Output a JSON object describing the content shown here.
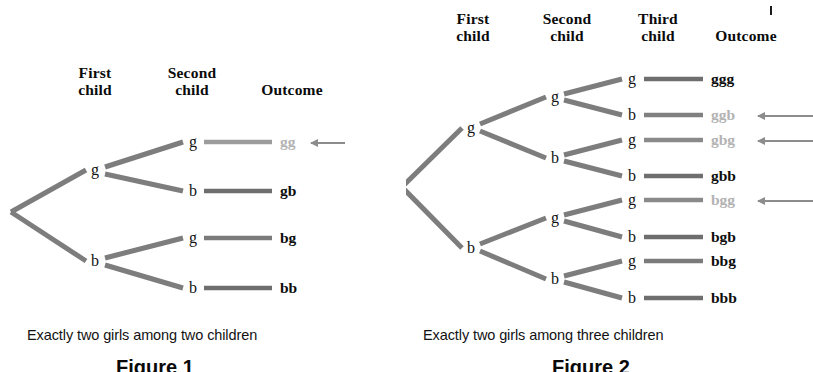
{
  "figure": {
    "background_color": "#ffffff",
    "branch_color": "#7d7d7d",
    "leaf_line_color": "#6e6e6e",
    "dim_text_color": "#b3b3b3",
    "text_color": "#0d0d0d",
    "arrow_color": "#8c8c8c"
  },
  "panels": [
    {
      "id": "two-children",
      "headers": [
        "First\nchild",
        "Second\nchild",
        "Outcome"
      ],
      "caption": "Exactly two girls among two children",
      "fig_label": "Figure 1",
      "nodes_level1": [
        "g",
        "b"
      ],
      "nodes_level2": [
        "g",
        "b",
        "g",
        "b"
      ],
      "outcomes": [
        {
          "label": "gg",
          "highlighted": true,
          "arrow": true
        },
        {
          "label": "gb",
          "highlighted": false,
          "arrow": false
        },
        {
          "label": "bg",
          "highlighted": false,
          "arrow": false
        },
        {
          "label": "bb",
          "highlighted": false,
          "arrow": false
        }
      ]
    },
    {
      "id": "three-children",
      "headers": [
        "First\nchild",
        "Second\nchild",
        "Third\nchild",
        "Outcome"
      ],
      "caption": "Exactly two girls among three children",
      "fig_label": "Figure 2",
      "nodes_level1": [
        "g",
        "b"
      ],
      "nodes_level2": [
        "g",
        "b",
        "g",
        "b"
      ],
      "nodes_level3": [
        "g",
        "b",
        "g",
        "b",
        "g",
        "b",
        "g",
        "b"
      ],
      "outcomes": [
        {
          "label": "ggg",
          "highlighted": false,
          "arrow": false
        },
        {
          "label": "ggb",
          "highlighted": true,
          "arrow": true
        },
        {
          "label": "gbg",
          "highlighted": true,
          "arrow": true
        },
        {
          "label": "gbb",
          "highlighted": false,
          "arrow": false
        },
        {
          "label": "bgg",
          "highlighted": true,
          "arrow": true
        },
        {
          "label": "bgb",
          "highlighted": false,
          "arrow": false
        },
        {
          "label": "bbg",
          "highlighted": false,
          "arrow": false
        },
        {
          "label": "bbb",
          "highlighted": false,
          "arrow": false
        }
      ]
    }
  ]
}
